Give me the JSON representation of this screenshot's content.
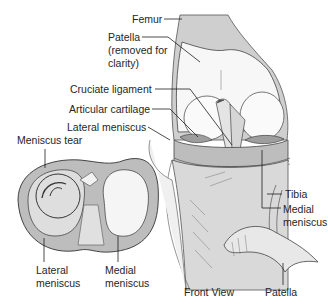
{
  "diagram": {
    "labels": {
      "femur": "Femur",
      "patella_top_line1": "Patella",
      "patella_top_line2": "(removed for",
      "patella_top_line3": "clarity)",
      "cruciate_ligament": "Cruciate ligament",
      "articular_cartilage": "Articular cartilage",
      "lateral_meniscus_front": "Lateral meniscus",
      "meniscus_tear": "Meniscus tear",
      "lateral_meniscus_top_line1": "Lateral",
      "lateral_meniscus_top_line2": "meniscus",
      "medial_meniscus_top_line1": "Medial",
      "medial_meniscus_top_line2": "meniscus",
      "tibia": "Tibia",
      "medial_meniscus_front_line1": "Medial",
      "medial_meniscus_front_line2": "meniscus",
      "front_view": "Front View",
      "patella_bottom": "Patella"
    },
    "colors": {
      "bone_light": "#f4f4f4",
      "bone_shade": "#c9c9c9",
      "cartilage": "#b5b5b5",
      "outline": "#3a3a3a",
      "leader": "#1e1e1e"
    }
  }
}
